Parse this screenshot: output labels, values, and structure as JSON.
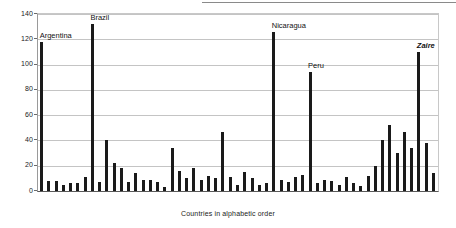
{
  "figure": {
    "top_rule": true,
    "background": "#ffffff",
    "bar_color": "#1a1a1a",
    "grid_color": "#c4c4c4",
    "axis_color": "#5a5a5a"
  },
  "chart_data": {
    "type": "bar",
    "title": "",
    "subtitle": "",
    "xlabel": "Countries in alphabetic order",
    "ylabel": "",
    "ylim": [
      0,
      140
    ],
    "yticks": [
      0,
      20,
      40,
      60,
      80,
      100,
      120,
      140
    ],
    "ytick_labels": [
      "0",
      "20",
      "40",
      "60",
      "80",
      "100",
      "120",
      "140"
    ],
    "grid": true,
    "grid_axis": "y",
    "legend": false,
    "xtick_labels": [],
    "categories": [
      "Argentina",
      "c2",
      "c3",
      "c4",
      "c5",
      "c6",
      "c7",
      "Brazil",
      "c9",
      "c10",
      "c11",
      "c12",
      "c13",
      "c14",
      "c15",
      "c16",
      "c17",
      "c18",
      "c19",
      "c20",
      "c21",
      "c22",
      "c23",
      "c24",
      "c25",
      "c26",
      "c27",
      "c28",
      "c29",
      "c30",
      "c31",
      "c32",
      "Nicaragua",
      "c34",
      "c35",
      "c36",
      "c37",
      "Peru",
      "c39",
      "c40",
      "c41",
      "c42",
      "c43",
      "c44",
      "c45",
      "c46",
      "c47",
      "c48",
      "c49",
      "c50",
      "c51",
      "c52",
      "Zaire",
      "c54",
      "c55"
    ],
    "values": [
      118,
      8,
      8,
      5,
      6,
      6,
      11,
      132,
      7,
      40,
      22,
      18,
      7,
      14,
      9,
      9,
      7,
      3,
      34,
      16,
      10,
      18,
      9,
      12,
      10,
      47,
      11,
      5,
      15,
      10,
      5,
      6,
      126,
      9,
      7,
      11,
      13,
      94,
      6,
      9,
      8,
      5,
      11,
      6,
      4,
      12,
      20,
      40,
      52,
      30,
      47,
      34,
      110,
      38,
      14
    ],
    "annotations": [
      {
        "label": "Argentina",
        "value": 118,
        "index": 0,
        "style": "plain"
      },
      {
        "label": "Brazil",
        "value": 132,
        "index": 7,
        "style": "plain"
      },
      {
        "label": "Nicaragua",
        "value": 126,
        "index": 32,
        "style": "plain"
      },
      {
        "label": "Peru",
        "value": 94,
        "index": 37,
        "style": "plain"
      },
      {
        "label": "Zaire",
        "value": 110,
        "index": 52,
        "style": "italic"
      }
    ]
  }
}
